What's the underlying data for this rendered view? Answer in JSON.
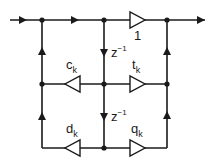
{
  "diagram": {
    "type": "lattice filter signal-flow graph",
    "gains": {
      "top": "1",
      "middle_left": {
        "base": "c",
        "sub": "k"
      },
      "middle_right": {
        "base": "t",
        "sub": "k"
      },
      "bottom_left": {
        "base": "d",
        "sub": "k"
      },
      "bottom_right": {
        "base": "q",
        "sub": "k"
      }
    },
    "delays": [
      {
        "base": "z",
        "sup": "−1"
      },
      {
        "base": "z",
        "sup": "−1"
      }
    ]
  },
  "colors": {
    "line": "#1a1a1a",
    "background": "#ffffff"
  }
}
